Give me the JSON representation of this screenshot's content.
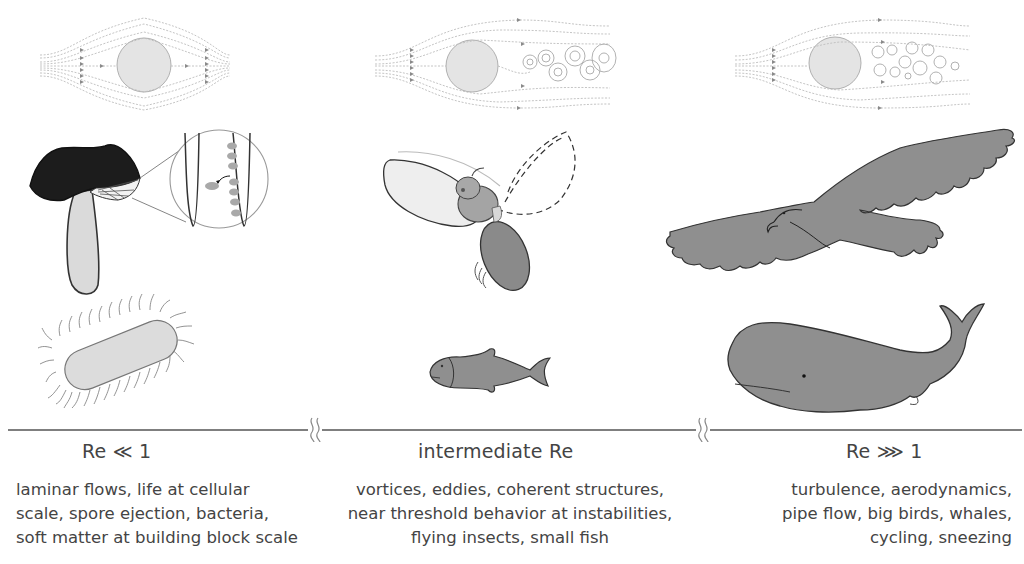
{
  "figure": {
    "colors": {
      "background": "#ffffff",
      "animal_fill": "#8f8f8f",
      "light_fill": "#dcdcdc",
      "dark_fill": "#1e1e1e",
      "streamline": "#b0b0b0",
      "axis_line": "#555555",
      "text": "#444444"
    },
    "flow_panels": [
      {
        "name": "laminar-flow",
        "description": "smooth streamlines around cylinder, symmetric"
      },
      {
        "name": "vortex-shedding-flow",
        "description": "streamlines with alternating vortex street behind cylinder"
      },
      {
        "name": "turbulent-flow",
        "description": "streamlines with chaotic turbulent wake behind cylinder"
      }
    ],
    "illustrations": {
      "low_re": [
        "mushroom-with-gill-spore-inset",
        "bacterium-with-flagella"
      ],
      "intermediate_re": [
        "flying-insect",
        "small-fish"
      ],
      "high_re": [
        "eagle",
        "sperm-whale"
      ]
    },
    "axis": {
      "break_symbol": "≀≀"
    },
    "regimes": [
      {
        "label": "Re  ≪  1",
        "lines": [
          "laminar flows, life at cellular",
          "scale, spore ejection, bacteria,",
          "soft matter at building block scale"
        ]
      },
      {
        "label": "intermediate Re",
        "lines": [
          "vortices, eddies, coherent structures,",
          "near threshold behavior at instabilities,",
          "flying insects, small fish"
        ]
      },
      {
        "label": "Re  ⋙  1",
        "lines": [
          "turbulence, aerodynamics,",
          "pipe flow, big birds, whales,",
          "cycling, sneezing"
        ]
      }
    ]
  }
}
